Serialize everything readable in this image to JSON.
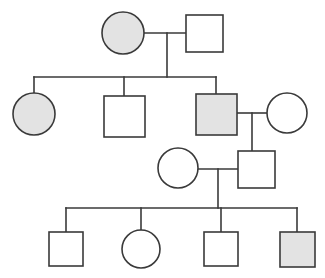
{
  "figure": {
    "background_color": "#ffffff",
    "line_color": "#3a3a3a",
    "affected_fill": "#e3e3e3",
    "unaffected_fill": "#ffffff",
    "stroke_width": 1.6,
    "width": 325,
    "height": 278
  },
  "legend": {
    "square_meaning": "male",
    "circle_meaning": "female",
    "shaded_meaning": "affected",
    "unshaded_meaning": "unaffected"
  },
  "chart_data": {
    "type": "diagram",
    "diagram_kind": "pedigree",
    "generation_count": 4,
    "individual_count": 12,
    "affected_count": 4,
    "unaffected_count": 8,
    "generations": [
      {
        "generation": 1,
        "individuals": [
          {
            "id": "I-1",
            "shape": "circle",
            "sex": "female",
            "affected": true,
            "cx": 123,
            "cy": 33,
            "r": 21
          },
          {
            "id": "I-2",
            "shape": "square",
            "sex": "male",
            "affected": false,
            "x": 186,
            "y": 15,
            "size": 37
          }
        ],
        "matings": [
          {
            "id": "M-I",
            "partners": [
              "I-1",
              "I-2"
            ],
            "line_y": 33,
            "x_start": 144,
            "x_end": 186,
            "descent_x": 167,
            "descent_y_end": 77
          }
        ]
      },
      {
        "generation": 2,
        "sibship_line": {
          "y": 77,
          "x_start": 34,
          "x_end": 216,
          "parents_mating": "M-I"
        },
        "individuals": [
          {
            "id": "II-1",
            "shape": "circle",
            "sex": "female",
            "affected": true,
            "cx": 34,
            "cy": 114,
            "r": 21,
            "drop_x": 34,
            "drop_y_start": 77,
            "drop_y_end": 93
          },
          {
            "id": "II-2",
            "shape": "square",
            "sex": "male",
            "affected": false,
            "x": 104,
            "y": 96,
            "size": 41,
            "drop_x": 124,
            "drop_y_start": 77,
            "drop_y_end": 96
          },
          {
            "id": "II-3",
            "shape": "square",
            "sex": "male",
            "affected": true,
            "x": 196,
            "y": 94,
            "size": 41,
            "drop_x": 216,
            "drop_y_start": 77,
            "drop_y_end": 94
          },
          {
            "id": "II-4",
            "shape": "circle",
            "sex": "female",
            "affected": false,
            "cx": 287,
            "cy": 113,
            "r": 20
          }
        ],
        "matings": [
          {
            "id": "M-II",
            "partners": [
              "II-3",
              "II-4"
            ],
            "line_y": 113,
            "x_start": 237,
            "x_end": 267,
            "descent_x": 252,
            "descent_y_end": 151
          }
        ]
      },
      {
        "generation": 3,
        "individuals": [
          {
            "id": "III-1",
            "shape": "circle",
            "sex": "female",
            "affected": false,
            "cx": 178,
            "cy": 168,
            "r": 20
          },
          {
            "id": "III-2",
            "shape": "square",
            "sex": "male",
            "affected": false,
            "x": 238,
            "y": 151,
            "size": 37,
            "parents_mating": "M-II"
          }
        ],
        "matings": [
          {
            "id": "M-III",
            "partners": [
              "III-1",
              "III-2"
            ],
            "line_y": 169,
            "x_start": 198,
            "x_end": 238,
            "descent_x": 218,
            "descent_y_end": 208
          }
        ]
      },
      {
        "generation": 4,
        "sibship_line": {
          "y": 208,
          "x_start": 66,
          "x_end": 297,
          "parents_mating": "M-III"
        },
        "individuals": [
          {
            "id": "IV-1",
            "shape": "square",
            "sex": "male",
            "affected": false,
            "x": 49,
            "y": 232,
            "size": 34,
            "drop_x": 66,
            "drop_y_start": 208,
            "drop_y_end": 232
          },
          {
            "id": "IV-2",
            "shape": "circle",
            "sex": "female",
            "affected": false,
            "cx": 141,
            "cy": 249,
            "r": 19,
            "drop_x": 141,
            "drop_y_start": 208,
            "drop_y_end": 230
          },
          {
            "id": "IV-3",
            "shape": "square",
            "sex": "male",
            "affected": false,
            "x": 204,
            "y": 232,
            "size": 34,
            "drop_x": 221,
            "drop_y_start": 208,
            "drop_y_end": 232
          },
          {
            "id": "IV-4",
            "shape": "square",
            "sex": "male",
            "affected": true,
            "x": 280,
            "y": 232,
            "size": 35,
            "drop_x": 297,
            "drop_y_start": 208,
            "drop_y_end": 232
          }
        ]
      }
    ]
  }
}
